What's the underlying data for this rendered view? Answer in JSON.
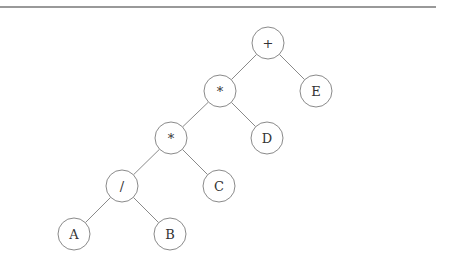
{
  "diagram": {
    "type": "expression-tree",
    "top_rule": {
      "x1": 0,
      "y1": 7,
      "x2": 436,
      "y2": 7,
      "color": "#777777"
    },
    "node_radius": 16,
    "colors": {
      "edge": "#8a8a8a",
      "node_stroke": "#8a8a8a",
      "node_fill": "#ffffff",
      "text": "#333333"
    },
    "nodes": [
      {
        "id": "n_plus",
        "label": "+",
        "x": 268,
        "y": 43
      },
      {
        "id": "n_mul1",
        "label": "*",
        "x": 220,
        "y": 91
      },
      {
        "id": "n_E",
        "label": "E",
        "x": 316,
        "y": 91
      },
      {
        "id": "n_mul2",
        "label": "*",
        "x": 171,
        "y": 138
      },
      {
        "id": "n_D",
        "label": "D",
        "x": 267,
        "y": 138
      },
      {
        "id": "n_div",
        "label": "/",
        "x": 122,
        "y": 186
      },
      {
        "id": "n_C",
        "label": "C",
        "x": 219,
        "y": 186
      },
      {
        "id": "n_A",
        "label": "A",
        "x": 74,
        "y": 234
      },
      {
        "id": "n_B",
        "label": "B",
        "x": 170,
        "y": 234
      }
    ],
    "edges": [
      {
        "from": "n_plus",
        "to": "n_mul1"
      },
      {
        "from": "n_plus",
        "to": "n_E"
      },
      {
        "from": "n_mul1",
        "to": "n_mul2"
      },
      {
        "from": "n_mul1",
        "to": "n_D"
      },
      {
        "from": "n_mul2",
        "to": "n_div"
      },
      {
        "from": "n_mul2",
        "to": "n_C"
      },
      {
        "from": "n_div",
        "to": "n_A"
      },
      {
        "from": "n_div",
        "to": "n_B"
      }
    ]
  }
}
